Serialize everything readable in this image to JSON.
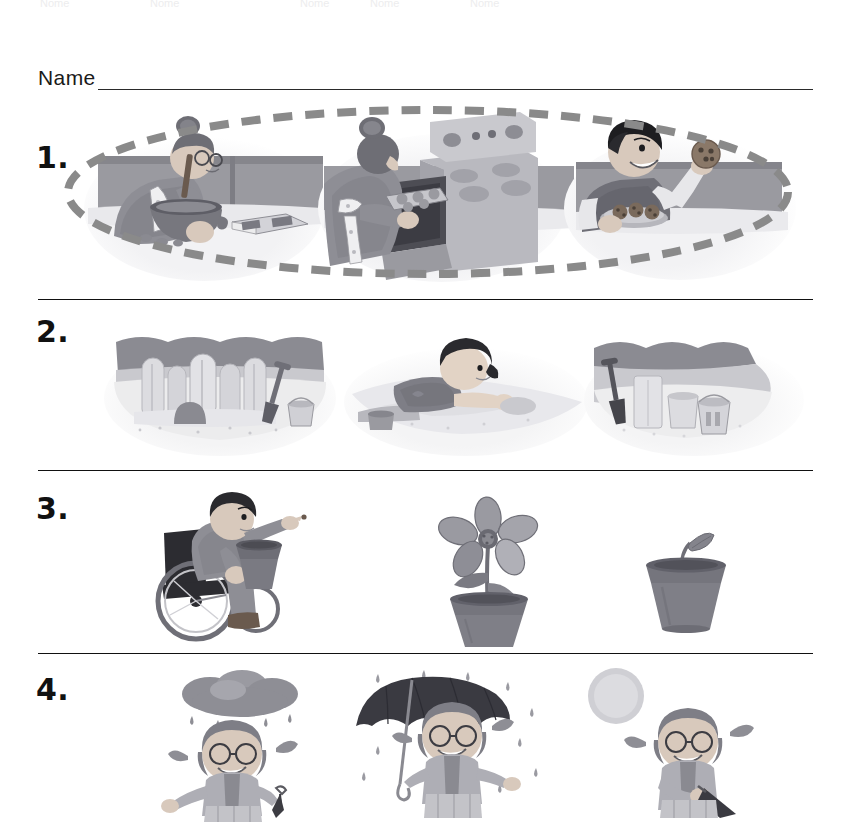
{
  "page": {
    "type": "sequencing-worksheet",
    "top_edge_fragments": [
      "Nome",
      "Nome",
      "Nome",
      "Nome",
      "Nome"
    ],
    "name_label": "Name",
    "name_value": ""
  },
  "palette": {
    "ink": "#111111",
    "rule": "#2a2a2a",
    "answer_mark": "#8a8a8a",
    "art_dark": "#55555a",
    "art_mid": "#8e8e94",
    "art_light": "#c3c3c8",
    "art_pale": "#e2e2e6",
    "paper": "#ffffff"
  },
  "rows": [
    {
      "number": "1.",
      "topic": "baking-cookies",
      "marked": true,
      "answer_mark": "dashed-oval-around-all-three",
      "pictures": [
        {
          "id": "mixing-batter",
          "caption": "Woman stirring batter in a mixing bowl with an open cookbook on the counter",
          "order": 1
        },
        {
          "id": "tray-into-oven",
          "caption": "Woman sliding a tray of cookie dough into the oven",
          "order": 2
        },
        {
          "id": "boy-eating-cookie",
          "caption": "Boy holding up a cookie beside a plate of baked cookies",
          "order": 3
        }
      ]
    },
    {
      "number": "2.",
      "topic": "sandcastle",
      "marked": false,
      "answer_mark": "",
      "pictures": [
        {
          "id": "finished-sandcastle",
          "caption": "Completed sandcastle with towers, shovel and pail beside it",
          "order": 3
        },
        {
          "id": "child-digging-sand",
          "caption": "Child lying on the sand shaping and digging",
          "order": 2
        },
        {
          "id": "sand-tools-start",
          "caption": "Shovel, pail and sand molds at the start of building",
          "order": 1
        }
      ]
    },
    {
      "number": "3.",
      "topic": "planting-a-seed",
      "marked": false,
      "answer_mark": "",
      "pictures": [
        {
          "id": "child-wheelchair-planting",
          "caption": "Child in a wheelchair holding a flower pot and dropping in a seed",
          "order": 1
        },
        {
          "id": "flower-in-bloom",
          "caption": "Tall flower in full bloom in a clay pot",
          "order": 3
        },
        {
          "id": "sprout-in-pot",
          "caption": "Small green sprout just coming up in a clay pot",
          "order": 2
        }
      ]
    },
    {
      "number": "4.",
      "topic": "rainy-day",
      "marked": false,
      "answer_mark": "",
      "pictures": [
        {
          "id": "rain-cloud-umbrella-closed",
          "caption": "Girl with glasses under a rain cloud holding a closed umbrella",
          "order": 1
        },
        {
          "id": "umbrella-open-in-rain",
          "caption": "Girl holding an open umbrella while rain falls around her",
          "order": 2
        },
        {
          "id": "sunshine-umbrella-down",
          "caption": "Girl smiling in the sunshine with the umbrella lowered",
          "order": 3
        }
      ]
    }
  ]
}
